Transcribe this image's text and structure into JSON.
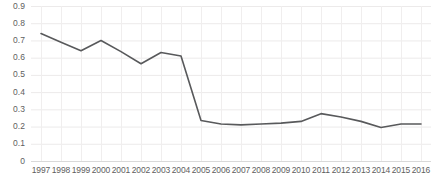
{
  "chart_data": {
    "type": "line",
    "title": "",
    "subtitle": "",
    "xlabel": "",
    "ylabel": "",
    "categories": [
      "1997",
      "1998",
      "1999",
      "2000",
      "2001",
      "2002",
      "2003",
      "2004",
      "2005",
      "2006",
      "2007",
      "2008",
      "2009",
      "2010",
      "2011",
      "2012",
      "2013",
      "2014",
      "2015",
      "2016"
    ],
    "series": [
      {
        "name": "series-1",
        "color": "#58595b",
        "values": [
          0.74,
          0.69,
          0.64,
          0.7,
          0.635,
          0.565,
          0.63,
          0.61,
          0.235,
          0.215,
          0.21,
          0.215,
          0.22,
          0.23,
          0.275,
          0.255,
          0.23,
          0.195,
          0.215,
          0.215
        ]
      }
    ],
    "ylim": [
      0,
      0.9
    ],
    "xlim_categories": 20,
    "y_ticks": [
      "0",
      "0.1",
      "0.2",
      "0.3",
      "0.4",
      "0.5",
      "0.6",
      "0.7",
      "0.8",
      "0.9"
    ],
    "y_tick_values": [
      0,
      0.1,
      0.2,
      0.3,
      0.4,
      0.5,
      0.6,
      0.7,
      0.8,
      0.9
    ],
    "grid": {
      "horizontal": true,
      "vertical": true,
      "color": "#ececec"
    },
    "legend": {
      "visible": false,
      "position": "none",
      "entries": []
    },
    "annotations": []
  }
}
